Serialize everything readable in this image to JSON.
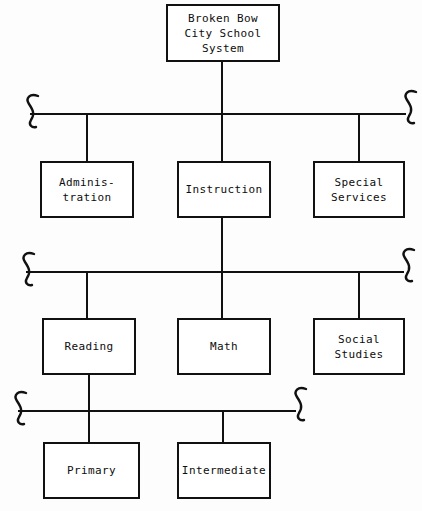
{
  "diagram": {
    "title_node": {
      "label": "Broken Bow\nCity School\nSystem"
    },
    "level2": [
      {
        "label": "Adminis-\ntration"
      },
      {
        "label": "Instruction"
      },
      {
        "label": "Special\nServices"
      }
    ],
    "level3": [
      {
        "label": "Reading"
      },
      {
        "label": "Math"
      },
      {
        "label": "Social\nStudies"
      }
    ],
    "level4": [
      {
        "label": "Primary"
      },
      {
        "label": "Intermediate"
      }
    ],
    "colors": {
      "line": "#111111",
      "box_border": "#111111",
      "background": "#fdfdfd",
      "text": "#0d0d0d"
    }
  }
}
